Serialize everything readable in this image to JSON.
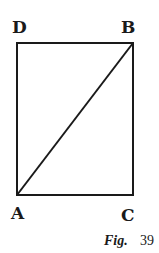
{
  "figure": {
    "caption_prefix": "Fig.",
    "caption_number": "39",
    "stroke_color": "#1a1a1a",
    "background": "#ffffff"
  },
  "points": {
    "A": "A",
    "B": "B",
    "C": "C",
    "D": "D"
  },
  "shapes": {
    "rectangle": "DBCA",
    "diagonal": "AB"
  }
}
